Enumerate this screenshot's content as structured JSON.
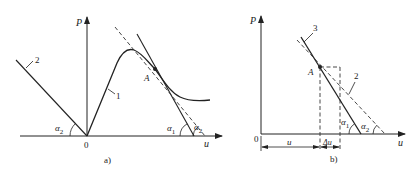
{
  "figure_a": {
    "caption": "a)",
    "y_axis_label": "P",
    "x_axis_label": "u",
    "origin_label": "0",
    "point_label": "A",
    "curve_1_label": "1",
    "line_2_label": "2",
    "angle_left": {
      "sym": "α",
      "sub": "2"
    },
    "angle_tangent": {
      "sym": "α",
      "sub": "1"
    },
    "angle_dashed": {
      "sym": "α",
      "sub": "2"
    }
  },
  "figure_b": {
    "caption": "b)",
    "y_axis_label": "P",
    "x_axis_label": "u",
    "origin_label": "0",
    "point_label": "A",
    "line_3_label": "3",
    "line_2_label": "2",
    "dim_u": "u",
    "dim_du": "Δu",
    "angle_solid": {
      "sym": "α",
      "sub": "1"
    },
    "angle_dashed": {
      "sym": "α",
      "sub": "2"
    }
  },
  "colors": {
    "ink": "#222222",
    "background": "#ffffff"
  }
}
